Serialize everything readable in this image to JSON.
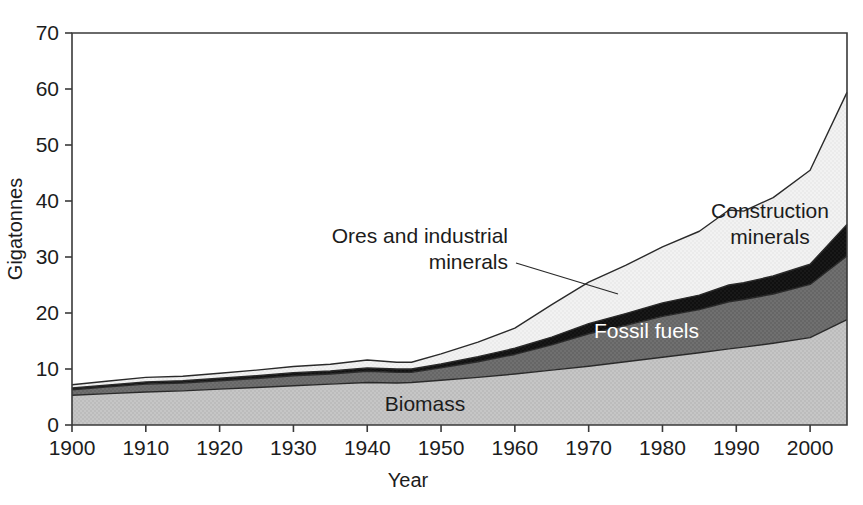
{
  "chart_data": {
    "type": "area",
    "title": "",
    "subtitle": "",
    "xlabel": "Year",
    "ylabel": "Gigatonnes",
    "xlim": [
      1900,
      2005
    ],
    "ylim": [
      0,
      70
    ],
    "ytick_labels": [
      "0",
      "10",
      "20",
      "30",
      "40",
      "50",
      "60",
      "70"
    ],
    "ytick_values": [
      0,
      10,
      20,
      30,
      40,
      50,
      60,
      70
    ],
    "xtick_labels": [
      "1900",
      "1910",
      "1920",
      "1930",
      "1940",
      "1950",
      "1960",
      "1970",
      "1980",
      "1990",
      "2000"
    ],
    "xtick_values": [
      1900,
      1910,
      1920,
      1930,
      1940,
      1950,
      1960,
      1970,
      1980,
      1990,
      2000
    ],
    "grid": false,
    "legend_position": "inline-annotations",
    "stacked": true,
    "x": [
      1900,
      1905,
      1910,
      1915,
      1920,
      1925,
      1930,
      1935,
      1940,
      1944,
      1946,
      1950,
      1955,
      1960,
      1965,
      1970,
      1975,
      1980,
      1985,
      1989,
      1991,
      1995,
      2000,
      2005
    ],
    "series": [
      {
        "name": "Biomass",
        "color": "#c2c2c2",
        "values": [
          5.3,
          5.6,
          5.9,
          6.1,
          6.4,
          6.7,
          7.0,
          7.3,
          7.6,
          7.5,
          7.6,
          8.0,
          8.5,
          9.1,
          9.8,
          10.5,
          11.3,
          12.1,
          12.9,
          13.6,
          13.9,
          14.6,
          15.6,
          18.8
        ]
      },
      {
        "name": "Fossil fuels",
        "color": "#6b6b6b",
        "values": [
          1.0,
          1.2,
          1.4,
          1.4,
          1.5,
          1.6,
          1.8,
          1.8,
          2.0,
          1.9,
          1.8,
          2.2,
          2.8,
          3.5,
          4.5,
          5.8,
          6.5,
          7.3,
          7.7,
          8.4,
          8.5,
          8.8,
          9.5,
          11.4
        ]
      },
      {
        "name": "Ores and industrial minerals",
        "color": "#151515",
        "values": [
          0.3,
          0.35,
          0.4,
          0.4,
          0.45,
          0.5,
          0.55,
          0.55,
          0.6,
          0.6,
          0.6,
          0.7,
          0.9,
          1.1,
          1.4,
          1.8,
          2.1,
          2.4,
          2.6,
          3.0,
          3.0,
          3.2,
          3.6,
          5.6
        ]
      },
      {
        "name": "Construction minerals",
        "color": "#f0f0f0",
        "values": [
          0.6,
          0.7,
          0.8,
          0.8,
          0.9,
          1.0,
          1.1,
          1.2,
          1.4,
          1.2,
          1.2,
          1.8,
          2.6,
          3.6,
          5.8,
          7.4,
          8.6,
          10.0,
          11.4,
          13.4,
          12.8,
          14.0,
          16.8,
          23.6
        ]
      }
    ],
    "totals": [
      7.2,
      7.85,
      8.5,
      8.7,
      9.25,
      9.8,
      10.45,
      10.85,
      11.6,
      11.2,
      11.2,
      12.7,
      14.8,
      17.3,
      21.5,
      25.5,
      28.5,
      31.8,
      34.6,
      38.4,
      38.2,
      40.6,
      45.5,
      59.4
    ]
  },
  "annotations": {
    "biomass": {
      "label": "Biomass",
      "style": "dark-on-light"
    },
    "fossil_fuels": {
      "label": "Fossil fuels",
      "style": "light-on-dark"
    },
    "ores_line1": "Ores and industrial",
    "ores_line2": "minerals",
    "construction_line1": "Construction",
    "construction_line2": "minerals"
  },
  "axes": {
    "y_title": "Gigatonnes",
    "x_title": "Year"
  },
  "colors": {
    "biomass": "#c2c2c2",
    "fossil_fuels": "#6b6b6b",
    "ores": "#151515",
    "construction": "#f0f0f0",
    "frame": "#3a3a3a",
    "text": "#1c1c1c",
    "background": "#ffffff"
  }
}
